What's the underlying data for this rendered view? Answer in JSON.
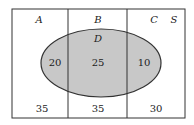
{
  "diagram": {
    "type": "venn",
    "universe_label": "S",
    "regions": [
      {
        "label": "A",
        "outside_D": "35",
        "inside_D": "20"
      },
      {
        "label": "B",
        "outside_D": "35",
        "inside_D": "25"
      },
      {
        "label": "C",
        "outside_D": "30",
        "inside_D": "10"
      }
    ],
    "ellipse_label": "D",
    "colors": {
      "ellipse_fill": "#c8c8c8",
      "stroke": "#333333",
      "background": "#ffffff"
    }
  }
}
